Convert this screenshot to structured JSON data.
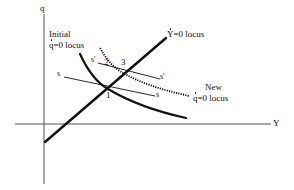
{
  "diagram": {
    "axes": {
      "x_label": "Y",
      "y_label": "q"
    },
    "curves": {
      "y_dot_locus": {
        "label_var": "Y",
        "label_rest": "=0 locus",
        "style": "solid-thick"
      },
      "initial_q_dot_locus": {
        "line1": "Initial",
        "label_var": "q",
        "label_rest": "=0 locus",
        "style": "solid-thick"
      },
      "new_q_dot_locus": {
        "line1": "New",
        "label_var": "q",
        "label_rest": "=0 locus",
        "style": "dotted"
      },
      "saddle_path_s": {
        "label_left": "s",
        "label_right": "s",
        "style": "thin"
      },
      "saddle_path_s_prime": {
        "label_left": "s'",
        "label_right": "s'",
        "style": "thin"
      }
    },
    "points": [
      {
        "id": "1",
        "label": "1"
      },
      {
        "id": "2",
        "label": "2"
      },
      {
        "id": "3",
        "label": "3"
      }
    ],
    "colors": {
      "ink": "#111111",
      "axis": "#555555",
      "background": "#ffffff"
    }
  }
}
